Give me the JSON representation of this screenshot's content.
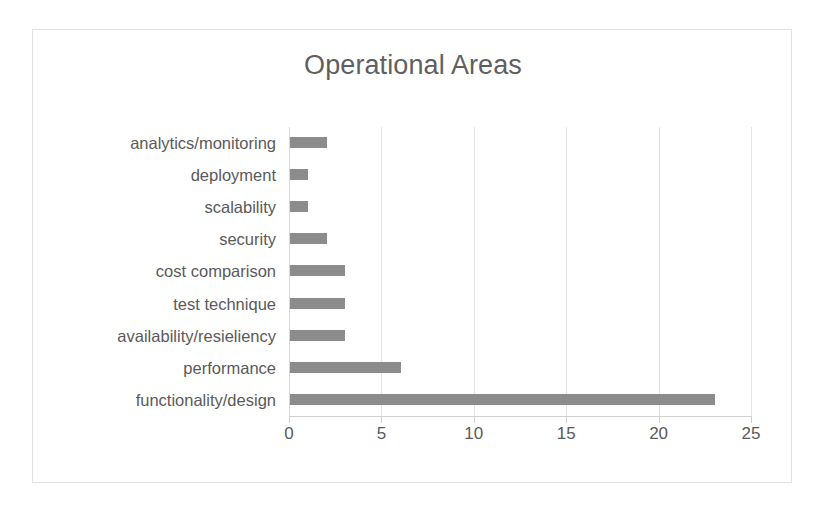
{
  "chart_data": {
    "type": "bar",
    "orientation": "horizontal",
    "title": "Operational Areas",
    "xlabel": "",
    "ylabel": "",
    "categories": [
      "analytics/monitoring",
      "deployment",
      "scalability",
      "security",
      "cost comparison",
      "test technique",
      "availability/resieliency",
      "performance",
      "functionality/design"
    ],
    "values": [
      2,
      1,
      1,
      2,
      3,
      3,
      3,
      6,
      23
    ],
    "xlim": [
      0,
      25
    ],
    "xticks": [
      0,
      5,
      10,
      15,
      20,
      25
    ],
    "xtick_labels": [
      "0",
      "5",
      "10",
      "15",
      "20",
      "25"
    ],
    "grid": true,
    "grid_axis": "x",
    "legend": false,
    "colors": {
      "bar": "#8c8c8c",
      "title_text": "#5f5f5f",
      "label_text": "#5a5a5a",
      "gridline": "#e4e4e4",
      "axis_line": "#d0d0d0",
      "frame_border": "#e2e2e2",
      "background": "#ffffff"
    }
  }
}
